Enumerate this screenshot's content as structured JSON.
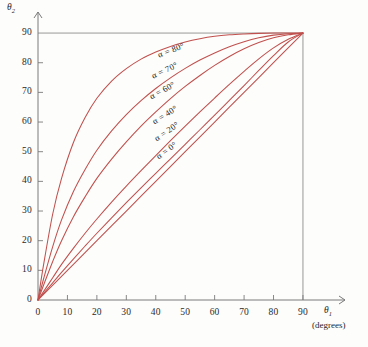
{
  "chart_data": {
    "type": "line",
    "title": "",
    "xlabel": "θ₁ (degrees)",
    "ylabel": "θ₂",
    "xlabel_symbol": "θ",
    "xlabel_sub": "1",
    "xlabel_unit": "(degrees)",
    "ylabel_symbol": "θ",
    "ylabel_sub": "2",
    "xlim": [
      0,
      100
    ],
    "ylim": [
      0,
      97
    ],
    "xticks": [
      0,
      10,
      20,
      30,
      40,
      50,
      60,
      70,
      80,
      90
    ],
    "yticks": [
      0,
      10,
      20,
      30,
      40,
      50,
      60,
      70,
      80,
      90
    ],
    "xticklabels": [
      "0",
      "10",
      "20",
      "30",
      "40",
      "50",
      "60",
      "70",
      "80",
      "90"
    ],
    "yticklabels": [
      "0",
      "10",
      "20",
      "30",
      "40",
      "50",
      "60",
      "70",
      "80",
      "90"
    ],
    "grid": "reference-lines-at-90",
    "legend": "inline-curve-labels",
    "curve_color": "#c0504d",
    "axis_color": "#7a7a7a",
    "convergence_point": [
      90,
      90
    ],
    "series": [
      {
        "name": "α = 80°",
        "alpha": 80,
        "label": "α = 80°",
        "label_x": 158,
        "label_y": 50,
        "label_rotation": -21,
        "x": [
          0,
          2,
          5,
          8,
          12,
          16,
          20,
          25,
          30,
          35,
          40,
          45,
          50,
          55,
          60,
          65,
          70,
          75,
          80,
          85,
          90
        ],
        "y": [
          0,
          12.5,
          29,
          41,
          53,
          61.5,
          68,
          73.8,
          78,
          81.2,
          83.6,
          85.5,
          87,
          88.1,
          88.9,
          89.4,
          89.7,
          89.9,
          90,
          90,
          90
        ]
      },
      {
        "name": "α = 70°",
        "alpha": 70,
        "label": "α = 70°",
        "label_x": 152,
        "label_y": 71,
        "label_rotation": -25,
        "x": [
          0,
          2,
          5,
          8,
          12,
          16,
          20,
          25,
          30,
          35,
          40,
          45,
          50,
          55,
          60,
          65,
          70,
          75,
          80,
          85,
          90
        ],
        "y": [
          0,
          7.5,
          18,
          27,
          36.5,
          44,
          50.5,
          57,
          62.5,
          67.2,
          71.3,
          74.9,
          78.1,
          80.9,
          83.3,
          85.4,
          87.1,
          88.4,
          89.3,
          89.8,
          90
        ]
      },
      {
        "name": "α = 60°",
        "alpha": 60,
        "label": "α = 60°",
        "label_x": 150,
        "label_y": 92,
        "label_rotation": -29,
        "x": [
          0,
          2,
          5,
          8,
          12,
          16,
          20,
          25,
          30,
          35,
          40,
          45,
          50,
          55,
          60,
          65,
          70,
          75,
          80,
          85,
          90
        ],
        "y": [
          0,
          5.3,
          13,
          20,
          28,
          34.8,
          41,
          47.5,
          53.3,
          58.6,
          63.4,
          67.9,
          72,
          75.7,
          79.1,
          82.1,
          84.7,
          86.8,
          88.4,
          89.4,
          90
        ]
      },
      {
        "name": "α = 40°",
        "alpha": 40,
        "label": "α = 40°",
        "label_x": 153,
        "label_y": 117,
        "label_rotation": -32,
        "x": [
          0,
          2,
          5,
          8,
          12,
          16,
          20,
          25,
          30,
          35,
          40,
          45,
          50,
          55,
          60,
          65,
          70,
          75,
          80,
          85,
          90
        ],
        "y": [
          0,
          3.0,
          7.5,
          12,
          17.4,
          22.5,
          27.3,
          33,
          38.4,
          43.6,
          48.7,
          53.7,
          58.6,
          63.4,
          68.1,
          72.7,
          77.1,
          81.3,
          85,
          87.9,
          90
        ]
      },
      {
        "name": "α = 20°",
        "alpha": 20,
        "label": "α = 20°",
        "label_x": 155,
        "label_y": 134,
        "label_rotation": -34,
        "x": [
          0,
          2,
          5,
          8,
          12,
          16,
          20,
          25,
          30,
          35,
          40,
          45,
          50,
          55,
          60,
          65,
          70,
          75,
          80,
          85,
          90
        ],
        "y": [
          0,
          2.3,
          5.8,
          9.3,
          13.8,
          18.2,
          22.5,
          27.7,
          32.8,
          37.8,
          42.7,
          47.6,
          52.5,
          57.4,
          62.3,
          67.3,
          72.3,
          77.4,
          82.4,
          87,
          90
        ]
      },
      {
        "name": "α = 0°",
        "alpha": 0,
        "label": "α = 0°",
        "label_x": 157,
        "label_y": 152,
        "label_rotation": -36,
        "x": [
          0,
          10,
          20,
          30,
          40,
          50,
          60,
          70,
          80,
          90
        ],
        "y": [
          0,
          10,
          20,
          30,
          40,
          50,
          60,
          70,
          80,
          90
        ]
      }
    ]
  },
  "geometry": {
    "origin_x": 38,
    "origin_y": 300,
    "px_per_unit_x": 2.944,
    "px_per_unit_y": 2.966,
    "x_axis_end": 345,
    "y_axis_top": 12
  }
}
